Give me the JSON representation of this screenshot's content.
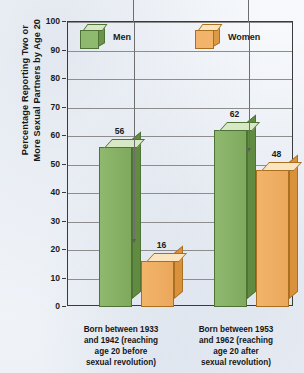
{
  "chart_data": {
    "type": "bar",
    "title": "",
    "xlabel": "",
    "ylabel": "Percentage Reporting Two or\nMore Sexual Partners by Age 20",
    "ylim": [
      0,
      100
    ],
    "yticks": [
      100,
      90,
      80,
      70,
      60,
      50,
      40,
      30,
      20,
      10,
      0
    ],
    "ytick_labels": [
      "100",
      "90",
      "80",
      "70",
      "60",
      "50",
      "40",
      "30",
      "20",
      "10",
      "0"
    ],
    "grid": true,
    "legend_position": "top-inside",
    "categories": [
      "Born between 1933\nand 1942 (reaching\nage 20 before\nsexual revolution)",
      "Born between 1953\nand 1962 (reaching\nage 20 after\nsexual revolution)"
    ],
    "series": [
      {
        "name": "Men",
        "color": "#8fb96e",
        "values": [
          56,
          62
        ],
        "value_labels": [
          "56",
          "62"
        ]
      },
      {
        "name": "Women",
        "color": "#f2b46a",
        "values": [
          16,
          48
        ],
        "value_labels": [
          "16",
          "48"
        ]
      }
    ],
    "annotations": [
      {
        "name": "arrow-to-women-group-1",
        "target_label": "16"
      },
      {
        "name": "arrow-to-women-group-2",
        "target_label": "48"
      }
    ]
  },
  "legend": {
    "items": [
      {
        "label": "Men",
        "icon": "green-cube-icon"
      },
      {
        "label": "Women",
        "icon": "orange-cube-icon"
      }
    ]
  },
  "axis": {
    "y_title": "Percentage Reporting Two or\nMore Sexual Partners by Age 20",
    "ticks": [
      "100",
      "90",
      "80",
      "70",
      "60",
      "50",
      "40",
      "30",
      "20",
      "10",
      "0"
    ]
  },
  "colors": {
    "men_bar": "#8fb96e",
    "men_bar_top": "#d7e8c4",
    "men_bar_side": "#628b42",
    "women_bar": "#f2b46a",
    "women_bar_top": "#fae5c0",
    "women_bar_side": "#d9913c",
    "axis": "#3b3b3b",
    "grid": "#8d8d8d",
    "background": "#f4f6f9"
  }
}
